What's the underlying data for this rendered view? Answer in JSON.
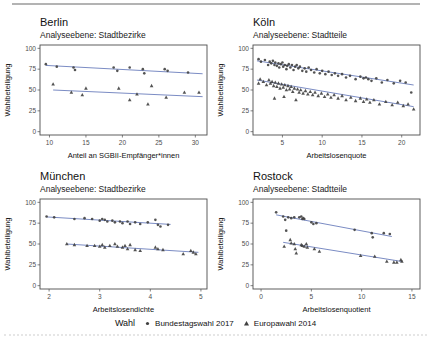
{
  "colors": {
    "point": "#404040",
    "trend": "#7b8cc4",
    "panel_border": "#4d4d4d",
    "axis_text": "#4d4d4d",
    "axis_title": "#111111",
    "rule": "#b3b3b3"
  },
  "legend": {
    "title": "Wahl",
    "items": [
      {
        "label": "Bundestagswahl 2017",
        "marker": "circle"
      },
      {
        "label": "Europawahl 2014",
        "marker": "triangle"
      }
    ]
  },
  "chart_data": [
    {
      "type": "scatter",
      "title": "Berlin",
      "subtitle": "Analyseebene: Stadtbezirke",
      "xlabel": "Anteil an SGBII-Empfänger*innen",
      "ylabel": "Wahlbeteiligung",
      "xlim": [
        8.7,
        31.6
      ],
      "ylim": [
        -4,
        104
      ],
      "xticks": [
        10,
        15,
        20,
        25,
        30
      ],
      "yticks": [
        0,
        25,
        50,
        75,
        100
      ],
      "grid": false,
      "series": [
        {
          "name": "Bundestagswahl 2017",
          "marker": "circle",
          "trend": [
            [
              9.5,
              79.5
            ],
            [
              31,
              69.5
            ]
          ],
          "points": [
            [
              9.5,
              81
            ],
            [
              11,
              78
            ],
            [
              13.3,
              77
            ],
            [
              13.5,
              74
            ],
            [
              18.8,
              77
            ],
            [
              19.3,
              73
            ],
            [
              21,
              77
            ],
            [
              22.8,
              75
            ],
            [
              23,
              70
            ],
            [
              25.8,
              75
            ],
            [
              26.2,
              73
            ],
            [
              29,
              71
            ]
          ]
        },
        {
          "name": "Europawahl 2014",
          "marker": "triangle",
          "trend": [
            [
              10.5,
              50
            ],
            [
              31,
              42
            ]
          ],
          "points": [
            [
              10.5,
              57
            ],
            [
              13,
              47
            ],
            [
              14.5,
              44
            ],
            [
              15,
              52
            ],
            [
              19.5,
              52
            ],
            [
              21,
              38
            ],
            [
              22,
              45
            ],
            [
              23.5,
              33
            ],
            [
              24,
              55
            ],
            [
              26,
              41
            ],
            [
              28.5,
              47
            ],
            [
              30.5,
              47
            ]
          ]
        }
      ]
    },
    {
      "type": "scatter",
      "title": "Köln",
      "subtitle": "Analyseebene: Stadtteile",
      "xlabel": "Arbeitslosenquote",
      "ylabel": "Wahlbeteiligung",
      "xlim": [
        1.3,
        22.3
      ],
      "ylim": [
        -4,
        104
      ],
      "xticks": [
        5,
        10,
        15,
        20
      ],
      "yticks": [
        0,
        25,
        50,
        75,
        100
      ],
      "grid": false,
      "series": [
        {
          "name": "Bundestagswahl 2017",
          "marker": "circle",
          "trend": [
            [
              1.8,
              85
            ],
            [
              21.5,
              56
            ]
          ],
          "points": [
            [
              2,
              87
            ],
            [
              2.3,
              84
            ],
            [
              2.8,
              86
            ],
            [
              3.2,
              80
            ],
            [
              3.4,
              84
            ],
            [
              3.6,
              82
            ],
            [
              3.8,
              85
            ],
            [
              4,
              80
            ],
            [
              4.1,
              83
            ],
            [
              4.3,
              79
            ],
            [
              4.5,
              82
            ],
            [
              4.6,
              77
            ],
            [
              4.8,
              81
            ],
            [
              5,
              83
            ],
            [
              5.1,
              78
            ],
            [
              5.3,
              80
            ],
            [
              5.5,
              75
            ],
            [
              5.6,
              79
            ],
            [
              5.8,
              81
            ],
            [
              6,
              77
            ],
            [
              6.2,
              80
            ],
            [
              6.4,
              74
            ],
            [
              6.6,
              78
            ],
            [
              6.8,
              80
            ],
            [
              7,
              76
            ],
            [
              7.2,
              78
            ],
            [
              7.5,
              73
            ],
            [
              7.8,
              76
            ],
            [
              8,
              72
            ],
            [
              8.3,
              77
            ],
            [
              8.6,
              74
            ],
            [
              9,
              71
            ],
            [
              9.3,
              75
            ],
            [
              9.7,
              70
            ],
            [
              10,
              73
            ],
            [
              10.4,
              69
            ],
            [
              10.8,
              72
            ],
            [
              11.2,
              68
            ],
            [
              11.6,
              70
            ],
            [
              12,
              67
            ],
            [
              12.5,
              69
            ],
            [
              13,
              65
            ],
            [
              13.5,
              67
            ],
            [
              14.2,
              63
            ],
            [
              14.8,
              66
            ],
            [
              15.2,
              64
            ],
            [
              15.5,
              65
            ],
            [
              15.8,
              63
            ],
            [
              16.2,
              61
            ],
            [
              16.8,
              64
            ],
            [
              17.5,
              59
            ],
            [
              18.2,
              62
            ],
            [
              19,
              58
            ],
            [
              19.8,
              61
            ],
            [
              20.5,
              59
            ],
            [
              21.2,
              47
            ]
          ]
        },
        {
          "name": "Europawahl 2014",
          "marker": "triangle",
          "trend": [
            [
              1.8,
              62
            ],
            [
              21.5,
              30
            ]
          ],
          "points": [
            [
              2,
              58
            ],
            [
              2.2,
              63
            ],
            [
              2.6,
              60
            ],
            [
              3,
              56
            ],
            [
              3.3,
              62
            ],
            [
              3.5,
              58
            ],
            [
              3.7,
              60
            ],
            [
              3.9,
              55
            ],
            [
              4,
              40
            ],
            [
              4.1,
              59
            ],
            [
              4.3,
              54
            ],
            [
              4.5,
              58
            ],
            [
              4.7,
              52
            ],
            [
              4.9,
              57
            ],
            [
              5.1,
              53
            ],
            [
              5.2,
              42
            ],
            [
              5.3,
              56
            ],
            [
              5.5,
              50
            ],
            [
              5.7,
              55
            ],
            [
              5.9,
              51
            ],
            [
              6.1,
              54
            ],
            [
              6.3,
              48
            ],
            [
              6.5,
              52
            ],
            [
              6.7,
              38
            ],
            [
              6.9,
              51
            ],
            [
              7.1,
              47
            ],
            [
              7.3,
              50
            ],
            [
              7.6,
              46
            ],
            [
              7.9,
              49
            ],
            [
              8.2,
              45
            ],
            [
              8.5,
              48
            ],
            [
              8.8,
              44
            ],
            [
              9.1,
              47
            ],
            [
              9.5,
              43
            ],
            [
              9.9,
              46
            ],
            [
              10.3,
              42
            ],
            [
              10.7,
              45
            ],
            [
              11.1,
              41
            ],
            [
              11.5,
              44
            ],
            [
              12,
              40
            ],
            [
              12.5,
              43
            ],
            [
              13,
              38
            ],
            [
              13.6,
              41
            ],
            [
              14.2,
              37
            ],
            [
              14.8,
              40
            ],
            [
              15.2,
              36
            ],
            [
              15.6,
              39
            ],
            [
              16,
              35
            ],
            [
              16.5,
              38
            ],
            [
              17.2,
              33
            ],
            [
              18,
              36
            ],
            [
              18.8,
              32
            ],
            [
              19.5,
              35
            ],
            [
              20.2,
              31
            ],
            [
              20.8,
              33
            ],
            [
              21.5,
              27
            ]
          ]
        }
      ]
    },
    {
      "type": "scatter",
      "title": "München",
      "subtitle": "Analyseebene: Stadtbezirke",
      "xlabel": "Arbeitslosendichte",
      "ylabel": "Wahlbeteiligung",
      "xlim": [
        1.82,
        5.12
      ],
      "ylim": [
        -4,
        104
      ],
      "xticks": [
        2,
        3,
        4,
        5
      ],
      "yticks": [
        0,
        25,
        50,
        75,
        100
      ],
      "grid": false,
      "series": [
        {
          "name": "Bundestagswahl 2017",
          "marker": "circle",
          "trend": [
            [
              1.95,
              82.5
            ],
            [
              4.4,
              73.5
            ]
          ],
          "points": [
            [
              1.95,
              83
            ],
            [
              2.1,
              82
            ],
            [
              2.5,
              80
            ],
            [
              2.7,
              81
            ],
            [
              2.85,
              80
            ],
            [
              3,
              78
            ],
            [
              3.05,
              80
            ],
            [
              3.1,
              79
            ],
            [
              3.15,
              77
            ],
            [
              3.25,
              78
            ],
            [
              3.3,
              76
            ],
            [
              3.4,
              77
            ],
            [
              3.45,
              75
            ],
            [
              3.55,
              77
            ],
            [
              3.6,
              74
            ],
            [
              3.7,
              76
            ],
            [
              3.8,
              74
            ],
            [
              3.95,
              76
            ],
            [
              4.1,
              79
            ],
            [
              4.15,
              73
            ],
            [
              4.2,
              71
            ],
            [
              4.35,
              73
            ]
          ]
        },
        {
          "name": "Europawahl 2014",
          "marker": "triangle",
          "trend": [
            [
              2.35,
              50
            ],
            [
              4.95,
              40
            ]
          ],
          "points": [
            [
              2.35,
              50
            ],
            [
              2.5,
              49
            ],
            [
              2.75,
              48
            ],
            [
              2.9,
              48
            ],
            [
              3,
              47
            ],
            [
              3.05,
              49
            ],
            [
              3.1,
              46
            ],
            [
              3.2,
              48
            ],
            [
              3.3,
              50
            ],
            [
              3.35,
              47
            ],
            [
              3.45,
              46
            ],
            [
              3.5,
              48
            ],
            [
              3.55,
              44
            ],
            [
              3.6,
              49
            ],
            [
              3.7,
              43
            ],
            [
              3.8,
              42
            ],
            [
              4.1,
              46
            ],
            [
              4.15,
              44
            ],
            [
              4.25,
              43
            ],
            [
              4.65,
              38
            ],
            [
              4.8,
              42
            ],
            [
              4.85,
              40
            ],
            [
              4.9,
              38
            ]
          ]
        }
      ]
    },
    {
      "type": "scatter",
      "title": "Rostock",
      "subtitle": "Analyseebene: Stadtteile",
      "xlabel": "Arbeitslosenquotient",
      "ylabel": "Wahlbeteiligung",
      "xlim": [
        -0.8,
        15.8
      ],
      "ylim": [
        -4,
        104
      ],
      "xticks": [
        0,
        5,
        10,
        15
      ],
      "yticks": [
        0,
        25,
        50,
        75,
        100
      ],
      "grid": false,
      "series": [
        {
          "name": "Bundestagswahl 2017",
          "marker": "circle",
          "trend": [
            [
              1.5,
              85
            ],
            [
              13,
              59
            ]
          ],
          "points": [
            [
              1.5,
              88
            ],
            [
              2.2,
              83
            ],
            [
              2.4,
              79
            ],
            [
              2.5,
              66
            ],
            [
              2.7,
              82
            ],
            [
              3,
              81
            ],
            [
              3.3,
              82
            ],
            [
              3.8,
              82
            ],
            [
              4,
              83
            ],
            [
              4.1,
              80
            ],
            [
              4.2,
              81
            ],
            [
              4.3,
              80
            ],
            [
              5,
              76
            ],
            [
              5.2,
              74
            ],
            [
              5.5,
              75
            ],
            [
              9.3,
              67
            ],
            [
              11,
              63
            ],
            [
              11.1,
              58
            ],
            [
              12.2,
              63
            ],
            [
              12.8,
              62
            ]
          ]
        },
        {
          "name": "Europawahl 2014",
          "marker": "triangle",
          "trend": [
            [
              2.2,
              52
            ],
            [
              14,
              29
            ]
          ],
          "points": [
            [
              2.3,
              47
            ],
            [
              2.9,
              55
            ],
            [
              3,
              51
            ],
            [
              3.3,
              50
            ],
            [
              3.4,
              44
            ],
            [
              3.5,
              39
            ],
            [
              4,
              49
            ],
            [
              4.1,
              48
            ],
            [
              4.3,
              47
            ],
            [
              4.5,
              50
            ],
            [
              4.6,
              46
            ],
            [
              5.3,
              44
            ],
            [
              5.8,
              41
            ],
            [
              9.9,
              36
            ],
            [
              11.3,
              35
            ],
            [
              12.5,
              29
            ],
            [
              13.2,
              28
            ],
            [
              13.5,
              28
            ],
            [
              13.9,
              31
            ],
            [
              14,
              29
            ]
          ]
        }
      ]
    }
  ]
}
